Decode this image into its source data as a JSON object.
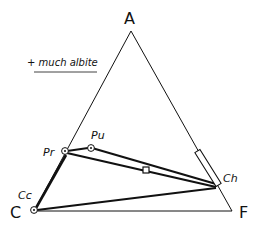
{
  "diagram": {
    "type": "ternary phase diagram (ACF)",
    "note": "+ much albite",
    "vertices": [
      {
        "id": "A",
        "label": "A"
      },
      {
        "id": "C",
        "label": "C"
      },
      {
        "id": "F",
        "label": "F"
      }
    ],
    "phases": [
      {
        "id": "Pr",
        "label": "Pr"
      },
      {
        "id": "Pu",
        "label": "Pu"
      },
      {
        "id": "Cc",
        "label": "Cc"
      },
      {
        "id": "Ch",
        "label": "Ch"
      }
    ],
    "tie_lines": [
      "Pr-Ch",
      "Pu-Ch",
      "Pr-Pu",
      "Cc-Pr",
      "Cc-Ch",
      "Cc-F"
    ],
    "colors": {
      "line": "#111111",
      "background": "#ffffff"
    }
  }
}
